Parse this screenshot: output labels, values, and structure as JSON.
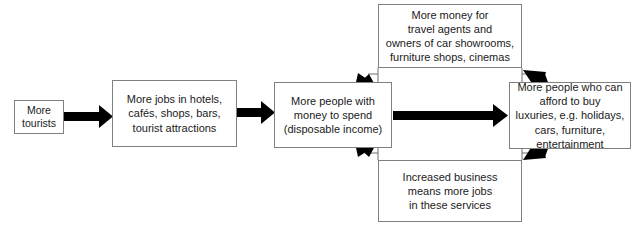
{
  "diagram": {
    "background_color": "#ffffff",
    "box_border_color": "#808080",
    "arrow_color": "#000000",
    "text_color": "#1a1a1a",
    "nodes": [
      {
        "id": "tourists",
        "label": "More\ntourists"
      },
      {
        "id": "jobs",
        "label": "More jobs in hotels,\ncafés, shops, bars,\ntourist attractions"
      },
      {
        "id": "disposable",
        "label": "More people with\nmoney to spend\n(disposable income)"
      },
      {
        "id": "money_for",
        "label": "More money for\ntravel agents and\nowners of car showrooms,\nfurniture shops, cinemas"
      },
      {
        "id": "luxuries",
        "label": "More people who can\nafford to buy\nluxuries, e.g. holidays,\ncars, furniture,\nentertainment"
      },
      {
        "id": "increased_business",
        "label": "Increased business\nmeans more jobs\nin these services"
      }
    ],
    "edges": [
      {
        "id": "tourists-to-jobs",
        "from": "tourists",
        "to": "jobs",
        "direction": "right"
      },
      {
        "id": "jobs-to-disposable",
        "from": "jobs",
        "to": "disposable",
        "direction": "right"
      },
      {
        "id": "disposable-to-luxuries",
        "from": "disposable",
        "to": "luxuries",
        "direction": "right"
      },
      {
        "id": "luxuries-to-money-for",
        "from": "luxuries",
        "to": "money_for",
        "direction": "up-left"
      },
      {
        "id": "money-for-to-disposable",
        "from": "money_for",
        "to": "disposable",
        "direction": "down-left"
      },
      {
        "id": "luxuries-to-increased-business",
        "from": "luxuries",
        "to": "increased_business",
        "direction": "down-left"
      },
      {
        "id": "increased-business-to-disposable",
        "from": "increased_business",
        "to": "disposable",
        "direction": "up-left"
      }
    ]
  }
}
